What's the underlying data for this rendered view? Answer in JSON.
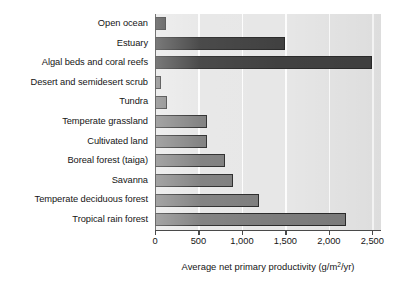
{
  "chart_data": {
    "type": "bar",
    "orientation": "horizontal",
    "title": "",
    "subtitle": "",
    "xlabel": "Average net primary productivity (g/m2/yr)",
    "xlabel_prefix": "Average net primary productivity (g/m",
    "xlabel_superscript": "2",
    "xlabel_suffix": "/yr)",
    "ylabel": "",
    "categories": [
      "Open ocean",
      "Estuary",
      "Algal beds and coral reefs",
      "Desert and semidesert scrub",
      "Tundra",
      "Temperate grassland",
      "Cultivated land",
      "Boreal forest (taiga)",
      "Savanna",
      "Temperate deciduous forest",
      "Tropical rain forest"
    ],
    "values": [
      125,
      1500,
      2500,
      70,
      140,
      600,
      600,
      800,
      900,
      1200,
      2200
    ],
    "bar_groups": [
      "aquatic",
      "aquatic",
      "aquatic",
      "terrestrial",
      "terrestrial",
      "terrestrial",
      "terrestrial",
      "terrestrial",
      "terrestrial",
      "terrestrial",
      "terrestrial"
    ],
    "xlim": [
      0,
      2600
    ],
    "xticks": [
      0,
      500,
      1000,
      1500,
      2000,
      2500
    ],
    "xticklabels": [
      "0",
      "500",
      "1,000",
      "1,500",
      "2,000",
      "2,500"
    ],
    "grid": true,
    "grid_axis": "x",
    "legend": null,
    "colors": {
      "aquatic_bar": "#414141",
      "terrestrial_bar": "#7d7d7d",
      "bar_outline": "#2b2b2b",
      "plot_background": "#e7e7e7",
      "gridline": "#fdfdfd",
      "axis": "#4a4a4a",
      "text": "#151515",
      "page_background": "#ffffff"
    }
  }
}
